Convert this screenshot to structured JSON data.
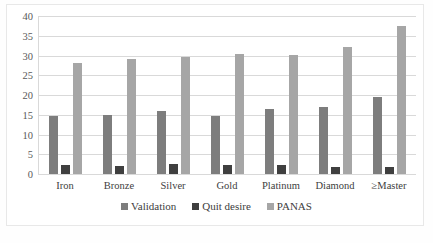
{
  "chart_data": {
    "type": "bar",
    "title": "",
    "xlabel": "",
    "ylabel": "",
    "ylim": [
      0,
      40
    ],
    "ytick_step": 5,
    "yticks": [
      "40",
      "35",
      "30",
      "25",
      "20",
      "15",
      "10",
      "5",
      "0"
    ],
    "grid": true,
    "legend_position": "bottom",
    "categories": [
      "Iron",
      "Bronze",
      "Silver",
      "Gold",
      "Platinum",
      "Diamond",
      "≥Master"
    ],
    "series": [
      {
        "name": "Validation",
        "color": "#7d7d7d",
        "values": [
          14.8,
          15.0,
          15.9,
          14.8,
          16.5,
          16.9,
          19.6
        ]
      },
      {
        "name": "Quit desire",
        "color": "#3f3f3f",
        "values": [
          2.3,
          2.1,
          2.5,
          2.3,
          2.3,
          1.8,
          1.8
        ]
      },
      {
        "name": "PANAS",
        "color": "#a6a6a6",
        "values": [
          28.2,
          29.1,
          29.6,
          30.3,
          30.2,
          32.1,
          37.5
        ]
      }
    ]
  },
  "legend": {
    "items": [
      {
        "label": "Validation"
      },
      {
        "label": "Quit desire"
      },
      {
        "label": "PANAS"
      }
    ]
  }
}
